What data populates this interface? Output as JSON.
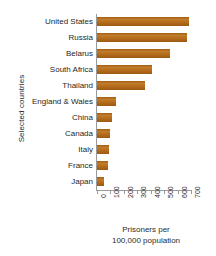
{
  "chart_data": {
    "type": "bar",
    "orientation": "horizontal",
    "title": "",
    "xlabel_line1": "Prisoners per",
    "xlabel_line2": "100,000 population",
    "ylabel": "Selected countries",
    "categories": [
      "United States",
      "Russia",
      "Belarus",
      "South Africa",
      "Thailand",
      "England & Wales",
      "China",
      "Canada",
      "Italy",
      "France",
      "Japan"
    ],
    "values": [
      685,
      670,
      545,
      410,
      360,
      145,
      110,
      100,
      90,
      80,
      50
    ],
    "xlim": [
      0,
      700
    ],
    "xticks": [
      0,
      100,
      200,
      300,
      400,
      500,
      600,
      700
    ],
    "xtick_labels": [
      "0",
      "100",
      "200",
      "300",
      "400",
      "500",
      "600",
      "700"
    ],
    "grid": false,
    "legend": false,
    "bar_color": "#b06a1c",
    "axis_color": "#9a9a9a",
    "background": "#ffffff"
  }
}
